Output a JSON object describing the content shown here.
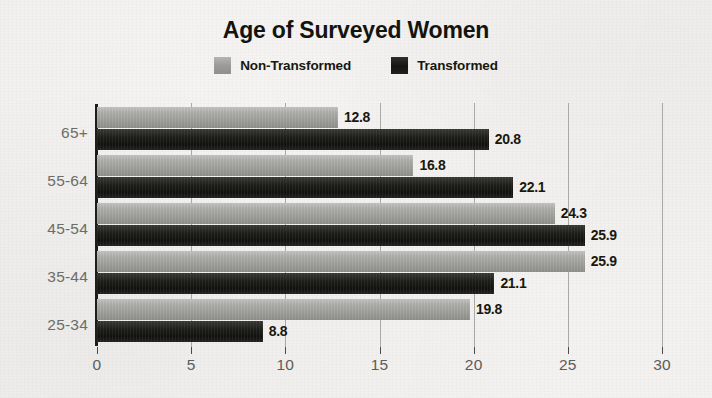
{
  "chart_data": {
    "type": "bar",
    "orientation": "horizontal",
    "title": "Age of Surveyed Women",
    "xlabel": "",
    "ylabel": "",
    "categories": [
      "25-34",
      "35-44",
      "45-54",
      "55-64",
      "65+"
    ],
    "series": [
      {
        "name": "Non-Transformed",
        "color": "#9c9c99",
        "values": [
          19.8,
          25.9,
          24.3,
          16.8,
          12.8
        ]
      },
      {
        "name": "Transformed",
        "color": "#141412",
        "values": [
          8.8,
          21.1,
          25.9,
          22.1,
          20.8
        ]
      }
    ],
    "xlim": [
      0,
      30
    ],
    "xticks": [
      0,
      5,
      10,
      15,
      20,
      25,
      30
    ],
    "xtick_labels": [
      "0",
      "5",
      "10",
      "15",
      "20",
      "25",
      "30"
    ],
    "grid": true,
    "grid_axis": "x",
    "legend_position": "top-center",
    "data_labels": true,
    "background_color": "#f6f5f3"
  },
  "title": {
    "text": "Age of Surveyed Women"
  },
  "legend": {
    "entries": [
      {
        "label": "Non-Transformed",
        "swatch": "gray-swatch-icon"
      },
      {
        "label": "Transformed",
        "swatch": "black-swatch-icon"
      }
    ]
  },
  "rows": [
    {
      "category": "65+",
      "non_transformed": {
        "value": 12.8,
        "label": "12.8"
      },
      "transformed": {
        "value": 20.8,
        "label": "20.8"
      }
    },
    {
      "category": "55-64",
      "non_transformed": {
        "value": 16.8,
        "label": "16.8"
      },
      "transformed": {
        "value": 22.1,
        "label": "22.1"
      }
    },
    {
      "category": "45-54",
      "non_transformed": {
        "value": 24.3,
        "label": "24.3"
      },
      "transformed": {
        "value": 25.9,
        "label": "25.9"
      }
    },
    {
      "category": "35-44",
      "non_transformed": {
        "value": 25.9,
        "label": "25.9"
      },
      "transformed": {
        "value": 21.1,
        "label": "21.1"
      }
    },
    {
      "category": "25-34",
      "non_transformed": {
        "value": 19.8,
        "label": "19.8"
      },
      "transformed": {
        "value": 8.8,
        "label": "8.8"
      }
    }
  ],
  "x_axis": {
    "ticks": [
      {
        "value": 0,
        "label": "0"
      },
      {
        "value": 5,
        "label": "5"
      },
      {
        "value": 10,
        "label": "10"
      },
      {
        "value": 15,
        "label": "15"
      },
      {
        "value": 20,
        "label": "20"
      },
      {
        "value": 25,
        "label": "25"
      },
      {
        "value": 30,
        "label": "30"
      }
    ]
  },
  "colors": {
    "non_transformed": "#9c9c99",
    "transformed": "#141412",
    "background": "#f6f5f3",
    "gridline": "#a9a9a6",
    "axis": "#1c1c1a",
    "tick_text": "#5c5c59"
  }
}
